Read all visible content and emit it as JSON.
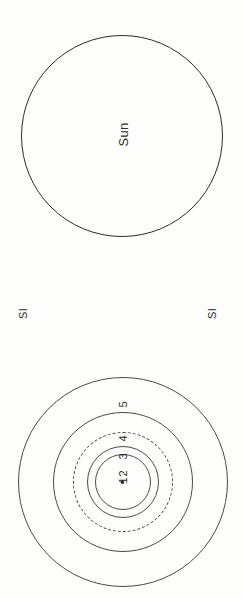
{
  "figure": {
    "sun_panel": {
      "circle_label": "Sun"
    },
    "scale_band": {
      "left_label": "SI",
      "right_label": "SI"
    },
    "rings_panel": {
      "center_marker": "",
      "rings": [
        {
          "label": "1",
          "style": "solid"
        },
        {
          "label": "2",
          "style": "solid"
        },
        {
          "label": "3",
          "style": "dashed"
        },
        {
          "label": "4",
          "style": "solid"
        },
        {
          "label": "5",
          "style": "solid"
        }
      ]
    }
  }
}
